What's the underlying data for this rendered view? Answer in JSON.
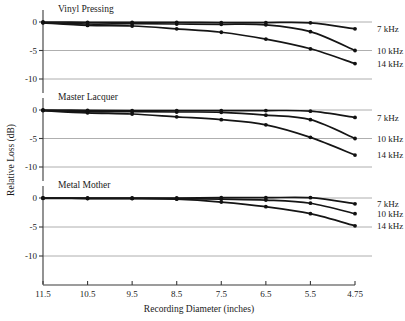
{
  "figure": {
    "xlabel": "Recording Diameter (inches)",
    "ylabel": "Relative Loss (dB)"
  },
  "chart_data": {
    "type": "line",
    "title": "",
    "xlabel": "Recording Diameter (inches)",
    "ylabel": "Relative Loss (dB)",
    "x_tick_labels": [
      "11.5",
      "10.5",
      "9.5",
      "8.5",
      "7.5",
      "6.5",
      "5.5",
      "4.75"
    ],
    "x_values": [
      11.5,
      10.5,
      9.5,
      8.5,
      7.5,
      6.5,
      5.5,
      4.75
    ],
    "x_axis_note": "categorical-even spacing; 4.75 plotted one step after 5.5",
    "y_tick_labels": [
      "0",
      "-5",
      "-10"
    ],
    "y_values": [
      0,
      -5,
      -10
    ],
    "ylim": [
      -13,
      1.5
    ],
    "grid": "horizontal gridlines at 0, -5, -10",
    "legend_position": "right of each panel, at curve endpoints",
    "legend_entries": [
      "7 kHz",
      "10 kHz",
      "14 kHz"
    ],
    "panels": [
      {
        "name": "Vinyl Pressing",
        "series": [
          {
            "name": "7 kHz",
            "x": [
              11.5,
              10.5,
              9.5,
              8.5,
              7.5,
              6.5,
              5.5,
              4.75
            ],
            "values": [
              0.0,
              -0.05,
              -0.05,
              -0.05,
              -0.1,
              -0.1,
              -0.15,
              -1.2
            ]
          },
          {
            "name": "10 kHz",
            "x": [
              11.5,
              10.5,
              9.5,
              8.5,
              7.5,
              6.5,
              5.5,
              4.75
            ],
            "values": [
              -0.1,
              -0.35,
              -0.3,
              -0.35,
              -0.4,
              -0.5,
              -1.7,
              -5.0
            ]
          },
          {
            "name": "14 kHz",
            "x": [
              11.5,
              10.5,
              9.5,
              8.5,
              7.5,
              6.5,
              5.5,
              4.75
            ],
            "values": [
              -0.15,
              -0.6,
              -0.7,
              -1.2,
              -1.8,
              -3.0,
              -4.7,
              -7.3
            ]
          }
        ]
      },
      {
        "name": "Master Lacquer",
        "series": [
          {
            "name": "7 kHz",
            "x": [
              11.5,
              10.5,
              9.5,
              8.5,
              7.5,
              6.5,
              5.5,
              4.75
            ],
            "values": [
              0.0,
              -0.05,
              -0.1,
              -0.1,
              -0.1,
              -0.1,
              -0.2,
              -1.3
            ]
          },
          {
            "name": "10 kHz",
            "x": [
              11.5,
              10.5,
              9.5,
              8.5,
              7.5,
              6.5,
              5.5,
              4.75
            ],
            "values": [
              -0.05,
              -0.3,
              -0.3,
              -0.35,
              -0.4,
              -0.9,
              -1.7,
              -5.0
            ]
          },
          {
            "name": "14 kHz",
            "x": [
              11.5,
              10.5,
              9.5,
              8.5,
              7.5,
              6.5,
              5.5,
              4.75
            ],
            "values": [
              -0.1,
              -0.5,
              -0.7,
              -1.2,
              -1.7,
              -2.6,
              -4.8,
              -7.9
            ]
          }
        ]
      },
      {
        "name": "Metal Mother",
        "series": [
          {
            "name": "7 kHz",
            "x": [
              11.5,
              10.5,
              9.5,
              8.5,
              7.5,
              6.5,
              5.5,
              4.75
            ],
            "values": [
              0.0,
              0.0,
              0.0,
              0.0,
              0.05,
              0.05,
              0.05,
              -1.0
            ]
          },
          {
            "name": "10 kHz",
            "x": [
              11.5,
              10.5,
              9.5,
              8.5,
              7.5,
              6.5,
              5.5,
              4.75
            ],
            "values": [
              0.0,
              -0.05,
              -0.05,
              -0.1,
              -0.2,
              -0.35,
              -0.9,
              -2.7
            ]
          },
          {
            "name": "14 kHz",
            "x": [
              11.5,
              10.5,
              9.5,
              8.5,
              7.5,
              6.5,
              5.5,
              4.75
            ],
            "values": [
              -0.05,
              -0.1,
              -0.1,
              -0.2,
              -0.7,
              -1.5,
              -2.7,
              -4.8
            ]
          }
        ]
      }
    ]
  }
}
